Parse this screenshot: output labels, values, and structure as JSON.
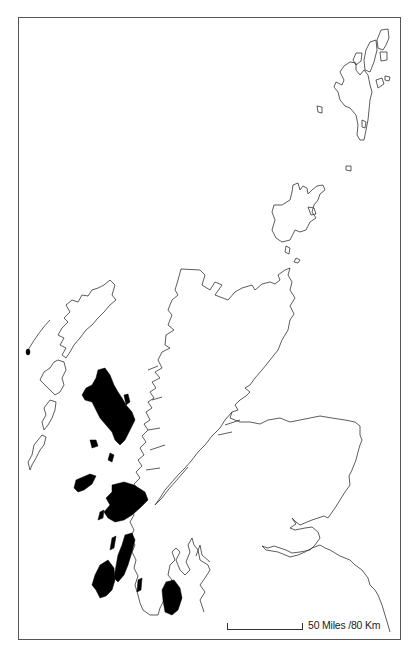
{
  "map": {
    "title": "Scotland outline map",
    "highlighted_areas": "Inner Hebrides / western islands (shaded black)",
    "colors": {
      "outline": "#333333",
      "shaded": "#000000",
      "background": "#ffffff",
      "frame": "#555555"
    }
  },
  "scale_bar": {
    "label": "50 Miles /80 Km"
  }
}
